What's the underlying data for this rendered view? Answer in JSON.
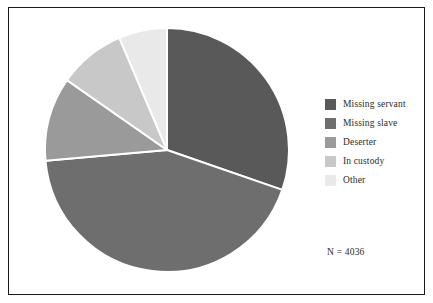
{
  "chart_data": {
    "type": "pie",
    "title": "",
    "subtitle": "",
    "xlabel": "",
    "ylabel": "",
    "grid": false,
    "legend_position": "right",
    "total_label": "N = 4036",
    "total": 4036,
    "start_angle_deg": 0,
    "direction": "clockwise",
    "categories": [
      "Missing servant",
      "Missing slave",
      "Deserter",
      "In custody",
      "Other"
    ],
    "values": [
      30.3,
      43.3,
      11.1,
      8.9,
      6.4
    ],
    "value_unit": "percent",
    "angles_deg": [
      109,
      156,
      40,
      32,
      23
    ],
    "colors": [
      "#595959",
      "#6e6e6e",
      "#9a9a9a",
      "#c8c8c8",
      "#e9e9e9"
    ],
    "slices": [
      {
        "label": "Missing servant",
        "value": 30.3,
        "angle_deg": 109,
        "color": "#595959"
      },
      {
        "label": "Missing slave",
        "value": 43.3,
        "angle_deg": 156,
        "color": "#6e6e6e"
      },
      {
        "label": "Deserter",
        "value": 11.1,
        "angle_deg": 40,
        "color": "#9a9a9a"
      },
      {
        "label": "In custody",
        "value": 8.9,
        "angle_deg": 32,
        "color": "#c8c8c8"
      },
      {
        "label": "Other",
        "value": 6.4,
        "angle_deg": 23,
        "color": "#e9e9e9"
      }
    ]
  },
  "legend": {
    "items": [
      {
        "label": "Missing servant",
        "color": "#595959"
      },
      {
        "label": "Missing slave",
        "color": "#6e6e6e"
      },
      {
        "label": "Deserter",
        "color": "#9a9a9a"
      },
      {
        "label": "In custody",
        "color": "#c8c8c8"
      },
      {
        "label": "Other",
        "color": "#e9e9e9"
      }
    ]
  },
  "annotation": {
    "sample_size_text": "N = 4036"
  },
  "style": {
    "frame_color": "#1a1a1a",
    "background": "#ffffff",
    "slice_separator": "#ffffff",
    "text_color": "#2b2b2b"
  },
  "geometry": {
    "center_x": 167,
    "center_y": 150,
    "radius": 122
  }
}
